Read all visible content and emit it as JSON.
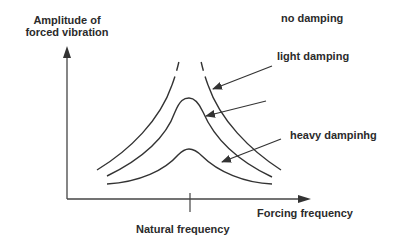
{
  "axes": {
    "y_label_line1": "Amplitude of",
    "y_label_line2": "forced vibration",
    "x_label": "Forcing frequency",
    "x_marker_label": "Natural frequency"
  },
  "curves": [
    {
      "label": "no damping",
      "style": "dashed-top",
      "peak": "unbounded"
    },
    {
      "label": "light damping",
      "style": "solid",
      "peak": "high"
    },
    {
      "label": "heavy dampinhg",
      "style": "solid",
      "peak": "low"
    }
  ],
  "colors": {
    "line": "#333333",
    "text": "#2b2b2b",
    "background": "#ffffff"
  }
}
